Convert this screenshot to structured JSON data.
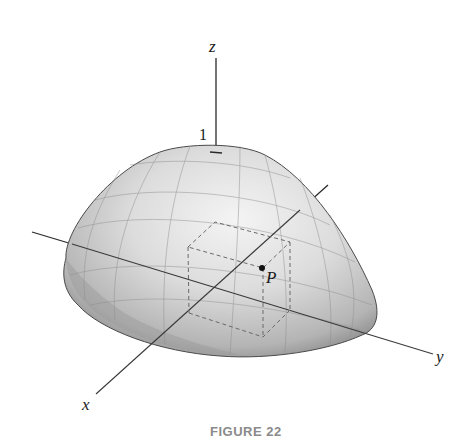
{
  "figure": {
    "caption": "FIGURE 22"
  },
  "axes": {
    "x_label": "x",
    "y_label": "y",
    "z_label": "z",
    "z_tick_label": "1"
  },
  "points": {
    "P_label": "P"
  },
  "colors": {
    "surface_light": "#f2f2f2",
    "surface_mid": "#c8c8c8",
    "surface_dark": "#6e6e6e",
    "axis": "#2a2a2a",
    "dashed_box": "#6a6a6a",
    "caption": "#8a8a8a"
  }
}
